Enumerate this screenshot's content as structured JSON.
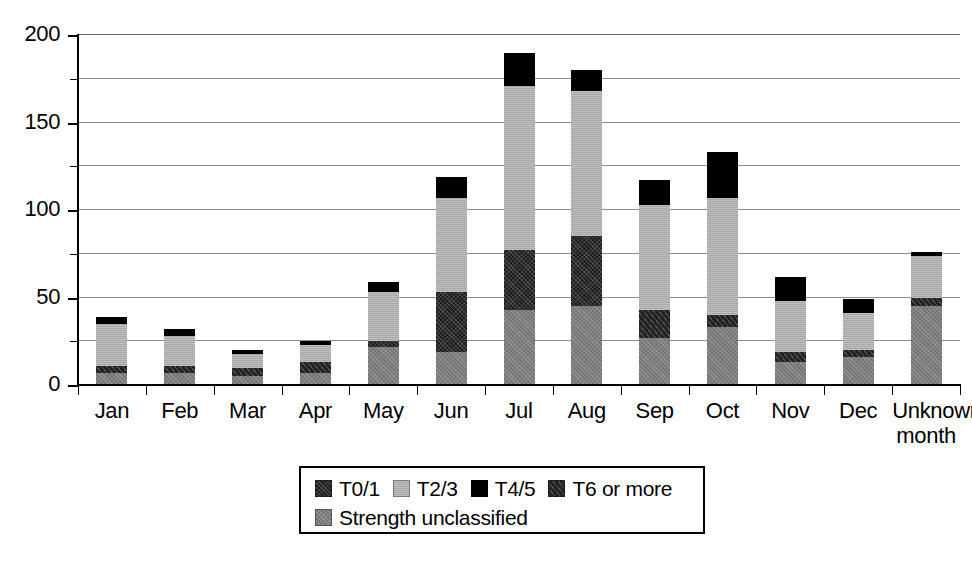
{
  "chart_data": {
    "type": "bar",
    "subtype": "stacked-bar",
    "title": "",
    "xlabel": "",
    "ylabel": "",
    "ylim": [
      0,
      200
    ],
    "ytick_labels": [
      "0",
      "50",
      "100",
      "150",
      "200"
    ],
    "ytick_values": [
      0,
      50,
      100,
      150,
      200
    ],
    "gridline_values": [
      0,
      25,
      50,
      75,
      100,
      125,
      150,
      175,
      200
    ],
    "grid": true,
    "legend_position": "bottom-center",
    "categories": [
      "Jan",
      "Feb",
      "Mar",
      "Apr",
      "May",
      "Jun",
      "Jul",
      "Aug",
      "Sep",
      "Oct",
      "Nov",
      "Dec",
      "Unknown\nmonth"
    ],
    "series": [
      {
        "name": "Strength unclassified",
        "color": "#7b7b7b",
        "values": [
          7,
          7,
          5,
          7,
          22,
          19,
          43,
          45,
          27,
          33,
          13,
          16,
          45
        ]
      },
      {
        "name": "T6 or more",
        "color": "#232323",
        "values": [
          4,
          4,
          5,
          6,
          0,
          0,
          0,
          0,
          16,
          7,
          6,
          4,
          5
        ]
      },
      {
        "name": "T0/1",
        "color": "#1d1d1d",
        "values": [
          0,
          0,
          0,
          0,
          3,
          34,
          34,
          40,
          0,
          0,
          0,
          0,
          0
        ]
      },
      {
        "name": "T2/3",
        "color": "#b0b0b0",
        "values": [
          24,
          17,
          8,
          10,
          28,
          54,
          94,
          83,
          60,
          67,
          29,
          21,
          24
        ]
      },
      {
        "name": "T4/5",
        "color": "#000000",
        "values": [
          4,
          4,
          2,
          2,
          6,
          12,
          19,
          12,
          14,
          26,
          14,
          8,
          2
        ]
      }
    ],
    "totals": [
      39,
      32,
      20,
      25,
      59,
      119,
      190,
      180,
      117,
      133,
      62,
      49,
      76
    ]
  },
  "legend": {
    "rows": [
      [
        {
          "label": "T0/1",
          "swatch": "t01"
        },
        {
          "label": "T2/3",
          "swatch": "t23"
        },
        {
          "label": "T4/5",
          "swatch": "t45"
        },
        {
          "label": "T6 or more",
          "swatch": "t6"
        }
      ],
      [
        {
          "label": "Strength unclassified",
          "swatch": "unclass"
        }
      ]
    ]
  }
}
